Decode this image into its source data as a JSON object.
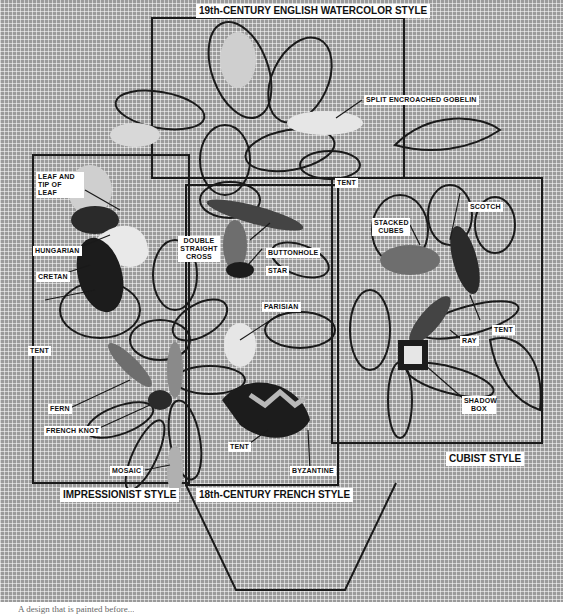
{
  "figure": {
    "panels": [
      {
        "id": "watercolor",
        "title": "19th-CENTURY ENGLISH WATERCOLOR STYLE"
      },
      {
        "id": "impressionist",
        "title": "IMPRESSIONIST STYLE"
      },
      {
        "id": "french",
        "title": "18th-CENTURY FRENCH STYLE"
      },
      {
        "id": "cubist",
        "title": "CUBIST STYLE"
      }
    ],
    "stitch_labels": {
      "split_encroached_gobelin": "SPLIT ENCROACHED GOBELIN",
      "tent_top": "TENT",
      "leaf_and_tip": "LEAF AND TIP OF LEAF",
      "hungarian": "HUNGARIAN",
      "cretan": "CRETAN",
      "tent_left": "TENT",
      "fern": "FERN",
      "french_knot": "FRENCH KNOT",
      "mosaic": "MOSAIC",
      "double_straight_cross": "DOUBLE STRAIGHT CROSS",
      "buttonhole": "BUTTONHOLE",
      "star": "STAR",
      "parisian": "PARISIAN",
      "tent_french": "TENT",
      "byzantine": "BYZANTINE",
      "stacked_cubes": "STACKED CUBES",
      "scotch": "SCOTCH",
      "tent_cubist": "TENT",
      "ray": "RAY",
      "shadow_box": "SHADOW BOX"
    },
    "caption": "A design that is painted before..."
  },
  "colors": {
    "canvas": "#9a9a9a",
    "outline": "#1a1a1a",
    "label_bg": "#ffffff",
    "dark_fill": "#1c1c1c",
    "light_fill": "#e6e6e6",
    "mid_fill": "#6e6e6e"
  }
}
